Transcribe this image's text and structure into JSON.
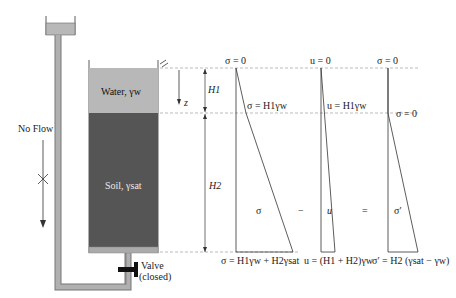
{
  "apparatus": {
    "flow_label": "No Flow",
    "water_label": "Water, γw",
    "soil_label": "Soil, γsat",
    "valve_label_line1": "Valve",
    "valve_label_line2": "(closed)",
    "depth_label": "z",
    "h1_label": "H1",
    "h2_label": "H2"
  },
  "colors": {
    "water": "#b8b8b8",
    "soil": "#555555",
    "pipe": "#a9a9a9",
    "line": "#333333",
    "dashed": "#999999"
  },
  "diagrams": {
    "total_stress": {
      "top_label": "σ = 0",
      "mid_label": "σ = H1γw",
      "center_label": "σ",
      "bottom_label": "σ = H1γw + H2γsat"
    },
    "minus_sign": "−",
    "pore_pressure": {
      "top_label": "u = 0",
      "mid_label": "u = H1γw",
      "center_label": "u",
      "bottom_label": "u = (H1 + H2)γw"
    },
    "equals_sign": "=",
    "effective_stress": {
      "top_label": "σ = 0",
      "mid_label": "σ = 0",
      "center_label": "σ′",
      "bottom_label": "σ′ = H2 (γsat − γw)"
    }
  }
}
